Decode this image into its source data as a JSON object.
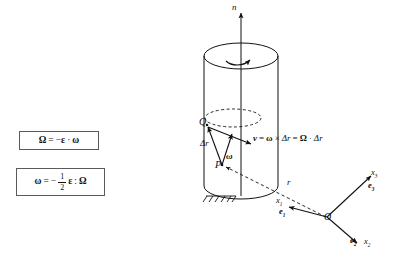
{
  "figure": {
    "background_color": "#ffffff",
    "ink_color": "#111111"
  },
  "equation_boxes": [
    {
      "id": "box1",
      "lhs": "Ω",
      "relation": "=",
      "sign": "−",
      "factor1": "ε",
      "operator": "·",
      "factor2": "ω",
      "plain_text": "Ω = −ε · ω"
    },
    {
      "id": "box2",
      "lhs": "ω",
      "relation": "=",
      "sign": "−",
      "numerator": "1",
      "denominator": "2",
      "factor1": "ε",
      "operator": ":",
      "factor2": "Ω",
      "plain_text": "ω = − 1/2 ε : Ω"
    }
  ],
  "main_equation": {
    "v": "v",
    "eq1": "=",
    "omega": "ω",
    "cross": "×",
    "delta_r_1": "Δr",
    "eq2": "=",
    "Omega": "Ω",
    "dot": "·",
    "delta_r_2": "Δr",
    "plain_text": "v = ω × Δr = Ω · Δr"
  },
  "labels": {
    "axis_n": "n",
    "point_Q": "Q",
    "point_P": "P",
    "delta_r": "Δr",
    "omega": "ω",
    "position_r": "r",
    "origin_O": "O",
    "x3": "x",
    "x3_sub": "3",
    "e3": "e",
    "e3_sub": "3",
    "x1": "x",
    "x1_sub": "1",
    "e1": "e",
    "e1_sub": "1",
    "x2": "x",
    "x2_sub": "2",
    "e2": "e",
    "e2_sub": "2"
  },
  "geometry": {
    "cylinder": {
      "axis_label": "n",
      "top_ellipse_center_x": 241,
      "top_ellipse_center_y": 56,
      "top_ellipse_rx": 37,
      "top_ellipse_ry": 13,
      "bottom_ellipse_center_y": 186,
      "body_top_y": 56,
      "body_bottom_y": 186,
      "rotation_arrow": "clockwise-curved-arrow-on-top-face"
    },
    "dashed_ellipse": {
      "center_x": 232,
      "center_y": 118,
      "rx": 28,
      "ry": 9,
      "style": "dashed",
      "meaning": "circular path traced by point Q"
    },
    "ground_support": {
      "x": 205,
      "y": 196,
      "width": 30,
      "style": "hatched-fixed-support"
    },
    "vectors": [
      {
        "name": "n-axis",
        "from": [
          241,
          186
        ],
        "to": [
          241,
          12
        ],
        "style": "solid-arrow"
      },
      {
        "name": "delta-r",
        "from": [
          222,
          165
        ],
        "to": [
          207,
          126
        ],
        "style": "solid-arrow"
      },
      {
        "name": "omega",
        "from": [
          222,
          165
        ],
        "to": [
          232,
          134
        ],
        "style": "solid-arrow"
      },
      {
        "name": "v",
        "from": [
          207,
          126
        ],
        "to": [
          250,
          143
        ],
        "style": "solid-arrow"
      },
      {
        "name": "r",
        "from": [
          327,
          218
        ],
        "to": [
          224,
          166
        ],
        "style": "dashed-arrow"
      },
      {
        "name": "x3-axis",
        "from": [
          327,
          218
        ],
        "to": [
          372,
          176
        ],
        "style": "solid-arrow"
      },
      {
        "name": "x1-axis",
        "from": [
          327,
          218
        ],
        "to": [
          288,
          207
        ],
        "style": "solid-arrow"
      },
      {
        "name": "x2-axis",
        "from": [
          327,
          218
        ],
        "to": [
          358,
          245
        ],
        "style": "solid-arrow"
      }
    ]
  }
}
